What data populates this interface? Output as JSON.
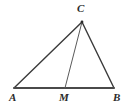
{
  "figure": {
    "type": "geometry-diagram",
    "background_color": "#ffffff",
    "stroke_color": "#3a3a3a",
    "base_stroke_color": "#4a4a4a",
    "cevian_stroke_color": "#5a5a5a",
    "label_color": "#2b2b2b",
    "points": {
      "A": {
        "label": "A",
        "x": 14,
        "y": 88
      },
      "B": {
        "label": "B",
        "x": 114,
        "y": 88
      },
      "C": {
        "label": "C",
        "x": 82,
        "y": 22
      },
      "M": {
        "label": "M",
        "x": 65,
        "y": 88
      }
    },
    "segments": [
      {
        "name": "AC",
        "from": "A",
        "to": "C",
        "width": 1.4
      },
      {
        "name": "CB",
        "from": "C",
        "to": "B",
        "width": 1.4
      },
      {
        "name": "AB",
        "from": "A",
        "to": "B",
        "width": 1.8
      },
      {
        "name": "CM",
        "from": "C",
        "to": "M",
        "width": 1.0
      }
    ],
    "labels": {
      "A": "A",
      "B": "B",
      "C": "C",
      "M": "M"
    }
  }
}
